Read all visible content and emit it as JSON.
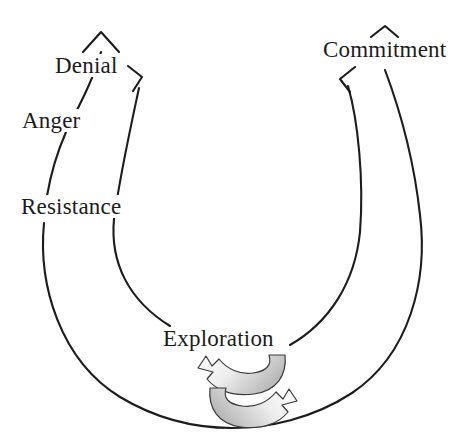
{
  "diagram": {
    "type": "cycle-diagram",
    "background_color": "#ffffff",
    "stroke_color": "#1c1c1c",
    "shade_color_light": "#e9e9e9",
    "shade_color_dark": "#b4b4b4",
    "stages": [
      {
        "id": "denial",
        "label": "Denial"
      },
      {
        "id": "anger",
        "label": "Anger"
      },
      {
        "id": "resistance",
        "label": "Resistance"
      },
      {
        "id": "exploration",
        "label": "Exploration"
      },
      {
        "id": "commitment",
        "label": "Commitment"
      }
    ],
    "connectors": [
      {
        "id": "resistance-to-denial",
        "arrow": "up",
        "from": "resistance",
        "to": "denial"
      },
      {
        "id": "denial-to-exploration",
        "arrow": "right",
        "from": "denial",
        "to": "exploration"
      },
      {
        "id": "commitment-to-exploration",
        "arrow": "left",
        "from": "commitment",
        "to": "exploration"
      },
      {
        "id": "exploration-to-commitment",
        "arrow": "up",
        "from": "exploration",
        "to": "commitment"
      }
    ],
    "swoosh_arrows": [
      {
        "id": "swoosh-upper",
        "direction": "left"
      },
      {
        "id": "swoosh-lower",
        "direction": "right"
      }
    ]
  }
}
